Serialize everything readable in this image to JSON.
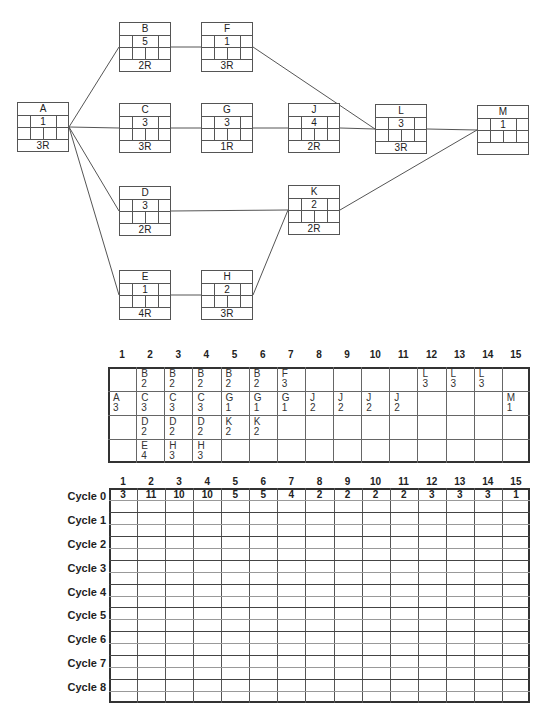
{
  "network": {
    "nodes": [
      {
        "id": "A",
        "duration": "1",
        "resources": "3R",
        "x": 17,
        "y": 102
      },
      {
        "id": "B",
        "duration": "5",
        "resources": "2R",
        "x": 119,
        "y": 22
      },
      {
        "id": "F",
        "duration": "1",
        "resources": "3R",
        "x": 201,
        "y": 22
      },
      {
        "id": "C",
        "duration": "3",
        "resources": "3R",
        "x": 119,
        "y": 103
      },
      {
        "id": "G",
        "duration": "3",
        "resources": "1R",
        "x": 201,
        "y": 103
      },
      {
        "id": "J",
        "duration": "4",
        "resources": "2R",
        "x": 288,
        "y": 103
      },
      {
        "id": "L",
        "duration": "3",
        "resources": "3R",
        "x": 375,
        "y": 104
      },
      {
        "id": "M",
        "duration": "1",
        "resources": "",
        "x": 477,
        "y": 105
      },
      {
        "id": "D",
        "duration": "3",
        "resources": "2R",
        "x": 119,
        "y": 186
      },
      {
        "id": "K",
        "duration": "2",
        "resources": "2R",
        "x": 288,
        "y": 185
      },
      {
        "id": "E",
        "duration": "1",
        "resources": "4R",
        "x": 119,
        "y": 270
      },
      {
        "id": "H",
        "duration": "2",
        "resources": "3R",
        "x": 201,
        "y": 270
      }
    ],
    "edges": [
      [
        "A",
        "B"
      ],
      [
        "A",
        "C"
      ],
      [
        "A",
        "D"
      ],
      [
        "A",
        "E"
      ],
      [
        "B",
        "F"
      ],
      [
        "F",
        "L"
      ],
      [
        "C",
        "G"
      ],
      [
        "G",
        "J"
      ],
      [
        "J",
        "L"
      ],
      [
        "L",
        "M"
      ],
      [
        "D",
        "K"
      ],
      [
        "E",
        "H"
      ],
      [
        "H",
        "K"
      ],
      [
        "K",
        "M"
      ]
    ]
  },
  "schedule": {
    "columns": [
      "1",
      "2",
      "3",
      "4",
      "5",
      "6",
      "7",
      "8",
      "9",
      "10",
      "11",
      "12",
      "13",
      "14",
      "15"
    ],
    "rows": [
      [
        [],
        [
          "B",
          "2"
        ],
        [
          "B",
          "2"
        ],
        [
          "B",
          "2"
        ],
        [
          "B",
          "2"
        ],
        [
          "B",
          "2"
        ],
        [
          "F",
          "3"
        ],
        [],
        [],
        [],
        [],
        [
          "L",
          "3"
        ],
        [
          "L",
          "3"
        ],
        [
          "L",
          "3"
        ],
        []
      ],
      [
        [
          "A",
          "3"
        ],
        [
          "C",
          "3"
        ],
        [
          "C",
          "3"
        ],
        [
          "C",
          "3"
        ],
        [
          "G",
          "1"
        ],
        [
          "G",
          "1"
        ],
        [
          "G",
          "1"
        ],
        [
          "J",
          "2"
        ],
        [
          "J",
          "2"
        ],
        [
          "J",
          "2"
        ],
        [
          "J",
          "2"
        ],
        [],
        [],
        [],
        [
          "M",
          "1"
        ]
      ],
      [
        [],
        [
          "D",
          "2"
        ],
        [
          "D",
          "2"
        ],
        [
          "D",
          "2"
        ],
        [
          "K",
          "2"
        ],
        [
          "K",
          "2"
        ],
        [],
        [],
        [],
        [],
        [],
        [],
        [],
        [],
        []
      ],
      [
        [],
        [
          "E",
          "4"
        ],
        [
          "H",
          "3"
        ],
        [
          "H",
          "3"
        ],
        [],
        [],
        [],
        [],
        [],
        [],
        [],
        [],
        [],
        [],
        []
      ]
    ]
  },
  "cycles": {
    "columns": [
      "1",
      "2",
      "3",
      "4",
      "5",
      "6",
      "7",
      "8",
      "9",
      "10",
      "11",
      "12",
      "13",
      "14",
      "15"
    ],
    "labels": [
      "Cycle 0",
      "Cycle 1",
      "Cycle 2",
      "Cycle 3",
      "Cycle 4",
      "Cycle 5",
      "Cycle 6",
      "Cycle 7",
      "Cycle 8"
    ],
    "cycle0_values": [
      "3",
      "11",
      "10",
      "10",
      "5",
      "5",
      "4",
      "2",
      "2",
      "2",
      "2",
      "3",
      "3",
      "3",
      "1"
    ]
  }
}
